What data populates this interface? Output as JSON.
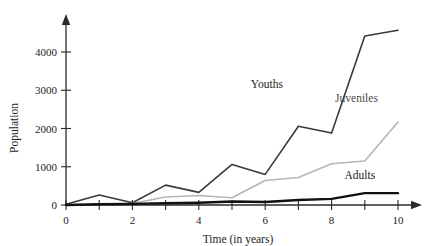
{
  "chart_data": {
    "type": "line",
    "title": "",
    "xlabel": "Time (in years)",
    "ylabel": "Population",
    "xlim": [
      0,
      10
    ],
    "ylim": [
      0,
      4800
    ],
    "grid": false,
    "legend_position": "inline-annotations",
    "x": [
      0,
      1,
      2,
      3,
      4,
      5,
      6,
      7,
      8,
      9,
      10
    ],
    "xticks": [
      0,
      1,
      2,
      3,
      4,
      5,
      6,
      7,
      8,
      9,
      10
    ],
    "xtick_labels": [
      "0",
      "",
      "2",
      "",
      "4",
      "",
      "6",
      "",
      "8",
      "",
      "10"
    ],
    "yticks": [
      0,
      1000,
      2000,
      3000,
      4000
    ],
    "ytick_labels": [
      "0",
      "1000",
      "2000",
      "3000",
      "4000"
    ],
    "series": [
      {
        "name": "Youths",
        "color": "#3a3a3a",
        "width": 1.6,
        "label_x": 6.05,
        "label_y": 3050,
        "values": [
          20,
          260,
          60,
          520,
          330,
          1060,
          800,
          2060,
          1880,
          4420,
          4570
        ]
      },
      {
        "name": "Juveniles",
        "color": "#b5b5b5",
        "width": 1.6,
        "label_x": 8.75,
        "label_y": 2700,
        "values": [
          0,
          20,
          40,
          210,
          250,
          190,
          640,
          720,
          1080,
          1150,
          2170
        ]
      },
      {
        "name": "Adults",
        "color": "#111111",
        "width": 2.4,
        "label_x": 8.85,
        "label_y": 690,
        "values": [
          0,
          20,
          30,
          45,
          60,
          90,
          80,
          130,
          160,
          310,
          310
        ]
      }
    ]
  },
  "axes": {
    "y_axis_name": "population-axis",
    "x_axis_name": "time-axis"
  }
}
